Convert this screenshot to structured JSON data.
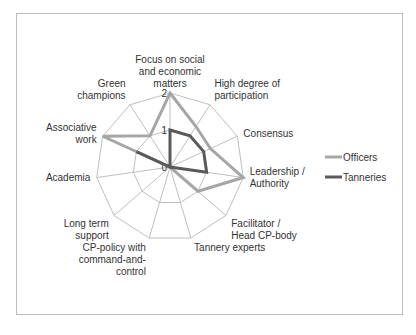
{
  "chart_data": {
    "type": "radar",
    "title": "",
    "axes": [
      "Focus on social and economic matters",
      "High degree of participation",
      "Consensus",
      "Leadership / Authority",
      "Facilitator / Head CP-body",
      "Tannery experts",
      "CP-policy with command-and-control",
      "Long term support",
      "Academia",
      "Associative work",
      "Green champions"
    ],
    "axis_label_lines": [
      [
        "Focus on social",
        "and economic",
        "matters"
      ],
      [
        "High degree of",
        "participation"
      ],
      [
        "Consensus"
      ],
      [
        "Leadership /",
        "Authority"
      ],
      [
        "Facilitator /",
        "Head CP-body"
      ],
      [
        "Tannery experts"
      ],
      [
        "CP-policy with",
        "command-and-",
        "control"
      ],
      [
        "Long term",
        "support"
      ],
      [
        "Academia"
      ],
      [
        "Associative",
        "work"
      ],
      [
        "Green",
        "champions"
      ]
    ],
    "ticks": [
      "0",
      "1",
      "2"
    ],
    "range": [
      0,
      2
    ],
    "series": [
      {
        "name": "Officers",
        "color": "#a6a6a6",
        "values": [
          2,
          1.3,
          1.2,
          2,
          1,
          0,
          0,
          0,
          0,
          2,
          1
        ]
      },
      {
        "name": "Tanneries",
        "color": "#595959",
        "values": [
          1,
          1,
          1,
          1,
          0,
          0,
          0,
          0,
          0,
          1,
          0
        ]
      }
    ],
    "legend_position": "right",
    "grid": true
  },
  "legend": {
    "items": [
      {
        "label": "Officers",
        "color": "#a6a6a6"
      },
      {
        "label": "Tanneries",
        "color": "#595959"
      }
    ]
  }
}
